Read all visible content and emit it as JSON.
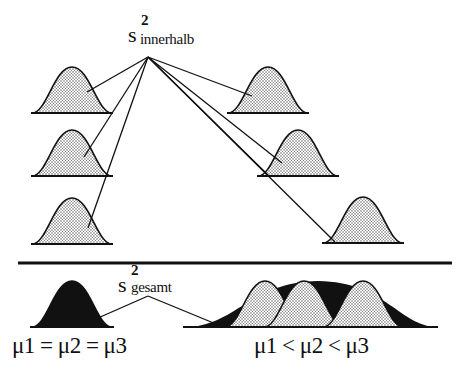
{
  "diagram": {
    "type": "variance-decomposition",
    "top_label": {
      "base": "s",
      "superscript": "2",
      "subscript": "innerhalb"
    },
    "bottom_label": {
      "base": "s",
      "superscript": "2",
      "subscript": "gesamt"
    },
    "left_condition": "μ1 = μ2 = μ3",
    "right_condition": "μ1 < μ2 < μ3",
    "colors": {
      "ink": "#111111",
      "fill_dots": "#d9d9d9",
      "fill_solid": "#111111",
      "background": "#ffffff"
    },
    "top_groups": {
      "left_column": [
        {
          "name": "group-1",
          "mean_x": 72,
          "baseline_y": 113
        },
        {
          "name": "group-2",
          "mean_x": 72,
          "baseline_y": 176
        },
        {
          "name": "group-3",
          "mean_x": 72,
          "baseline_y": 244
        }
      ],
      "right_column": [
        {
          "name": "group-1",
          "mean_x": 268,
          "baseline_y": 113
        },
        {
          "name": "group-2",
          "mean_x": 298,
          "baseline_y": 176
        },
        {
          "name": "group-3",
          "mean_x": 363,
          "baseline_y": 243
        }
      ]
    }
  }
}
